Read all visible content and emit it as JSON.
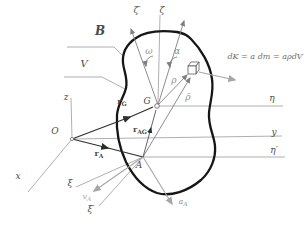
{
  "diagram": {
    "kind": "rigid-body kinetics figure",
    "colors": {
      "body_outline": "#161616",
      "thin_line": "#9a9a9a",
      "vector_dark": "#2e2e2e",
      "vector_gray": "#7f7f7f",
      "vector_light": "#a6a6a6",
      "text": "#4a4a4a"
    }
  },
  "labels": {
    "body": "B",
    "volume": "V",
    "origin": "O",
    "axis_x": "x",
    "axis_y": "y",
    "axis_z": "z",
    "axis_eta": "η",
    "axis_zeta": "ζ",
    "axis_xi": "ξ",
    "axis_eta_prime": "η′",
    "axis_zeta_prime": "ζ′",
    "axis_xi_prime": "ξ′",
    "point_G": "G",
    "point_A": "A",
    "omega": "ω",
    "alpha": "α",
    "rho": "ρ",
    "rho_bar": "ρ̄",
    "r_G": {
      "base": "r",
      "sub": "G"
    },
    "r_A": {
      "base": "r",
      "sub": "A"
    },
    "r_AG": {
      "base": "r",
      "sub": "AG"
    },
    "v_A": {
      "base": "v",
      "sub": "A"
    },
    "a_A": {
      "base": "a",
      "sub": "A"
    },
    "mass_element_formula": "dK = a dm = aρdV"
  }
}
